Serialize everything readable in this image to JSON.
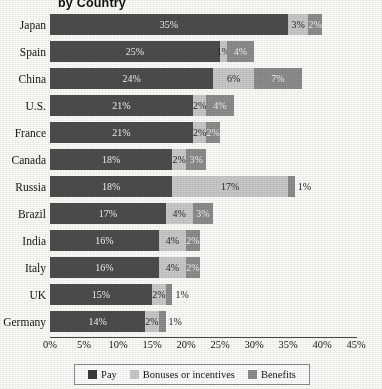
{
  "chart_data": {
    "type": "bar",
    "title": "by Country",
    "orientation": "horizontal",
    "stacked": true,
    "xlabel": "",
    "ylabel": "",
    "xlim": [
      0,
      45
    ],
    "grid": false,
    "legend_position": "bottom",
    "xticks": [
      "0%",
      "5%",
      "10%",
      "15%",
      "20%",
      "25%",
      "30%",
      "35%",
      "40%",
      "45%"
    ],
    "xtick_values": [
      0,
      5,
      10,
      15,
      20,
      25,
      30,
      35,
      40,
      45
    ],
    "categories": [
      "Japan",
      "Spain",
      "China",
      "U.S.",
      "France",
      "Canada",
      "Russia",
      "Brazil",
      "India",
      "Italy",
      "UK",
      "Germany"
    ],
    "series": [
      {
        "name": "Pay",
        "color": "#4d4d4d",
        "values": [
          35,
          25,
          24,
          21,
          21,
          18,
          18,
          17,
          16,
          16,
          15,
          14
        ],
        "labels": [
          "35%",
          "25%",
          "24%",
          "21%",
          "21%",
          "18%",
          "18%",
          "17%",
          "16%",
          "16%",
          "15%",
          "14%"
        ]
      },
      {
        "name": "Bonuses or incentives",
        "color": "#cacaca",
        "values": [
          3,
          1,
          6,
          2,
          2,
          2,
          17,
          4,
          4,
          4,
          2,
          2
        ],
        "labels": [
          "3%",
          "1%",
          "6%",
          "2%",
          "2%",
          "2%",
          "17%",
          "4%",
          "4%",
          "4%",
          "2%",
          "2%"
        ]
      },
      {
        "name": "Benefits",
        "color": "#8d8d8d",
        "values": [
          2,
          4,
          7,
          4,
          2,
          3,
          1,
          3,
          2,
          2,
          1,
          1
        ],
        "labels": [
          "2%",
          "4%",
          "7%",
          "4%",
          "2%",
          "3%",
          "1%",
          "3%",
          "2%",
          "2%",
          "1%",
          "1%"
        ]
      }
    ],
    "rows": [
      {
        "category": "Japan",
        "pay": 35,
        "pay_label": "35%",
        "bonus": 3,
        "bonus_label": "3%",
        "benefit": 2,
        "benefit_label": "2%",
        "benefit_label_outside": false,
        "bonus_label_outside": false
      },
      {
        "category": "Spain",
        "pay": 25,
        "pay_label": "25%",
        "bonus": 1,
        "bonus_label": "1%",
        "benefit": 4,
        "benefit_label": "4%",
        "benefit_label_outside": false,
        "bonus_label_outside": false
      },
      {
        "category": "China",
        "pay": 24,
        "pay_label": "24%",
        "bonus": 6,
        "bonus_label": "6%",
        "benefit": 7,
        "benefit_label": "7%",
        "benefit_label_outside": false,
        "bonus_label_outside": false
      },
      {
        "category": "U.S.",
        "pay": 21,
        "pay_label": "21%",
        "bonus": 2,
        "bonus_label": "2%",
        "benefit": 4,
        "benefit_label": "4%",
        "benefit_label_outside": false,
        "bonus_label_outside": false
      },
      {
        "category": "France",
        "pay": 21,
        "pay_label": "21%",
        "bonus": 2,
        "bonus_label": "2%",
        "benefit": 2,
        "benefit_label": "2%",
        "benefit_label_outside": false,
        "bonus_label_outside": false
      },
      {
        "category": "Canada",
        "pay": 18,
        "pay_label": "18%",
        "bonus": 2,
        "bonus_label": "2%",
        "benefit": 3,
        "benefit_label": "3%",
        "benefit_label_outside": false,
        "bonus_label_outside": false
      },
      {
        "category": "Russia",
        "pay": 18,
        "pay_label": "18%",
        "bonus": 17,
        "bonus_label": "17%",
        "benefit": 1,
        "benefit_label": "1%",
        "benefit_label_outside": true,
        "bonus_label_outside": false
      },
      {
        "category": "Brazil",
        "pay": 17,
        "pay_label": "17%",
        "bonus": 4,
        "bonus_label": "4%",
        "benefit": 3,
        "benefit_label": "3%",
        "benefit_label_outside": false,
        "bonus_label_outside": false
      },
      {
        "category": "India",
        "pay": 16,
        "pay_label": "16%",
        "bonus": 4,
        "bonus_label": "4%",
        "benefit": 2,
        "benefit_label": "2%",
        "benefit_label_outside": false,
        "bonus_label_outside": false
      },
      {
        "category": "Italy",
        "pay": 16,
        "pay_label": "16%",
        "bonus": 4,
        "bonus_label": "4%",
        "benefit": 2,
        "benefit_label": "2%",
        "benefit_label_outside": false,
        "bonus_label_outside": false
      },
      {
        "category": "UK",
        "pay": 15,
        "pay_label": "15%",
        "bonus": 2,
        "bonus_label": "2%",
        "benefit": 1,
        "benefit_label": "1%",
        "benefit_label_outside": true,
        "bonus_label_outside": false
      },
      {
        "category": "Germany",
        "pay": 14,
        "pay_label": "14%",
        "bonus": 2,
        "bonus_label": "2%",
        "benefit": 1,
        "benefit_label": "1%",
        "benefit_label_outside": true,
        "bonus_label_outside": false
      }
    ]
  },
  "legend": {
    "items": [
      {
        "label": "Pay",
        "color": "#3a3a3a"
      },
      {
        "label": "Bonuses or incentives",
        "color": "#cacaca"
      },
      {
        "label": "Benefits",
        "color": "#8d8d8d"
      }
    ]
  }
}
